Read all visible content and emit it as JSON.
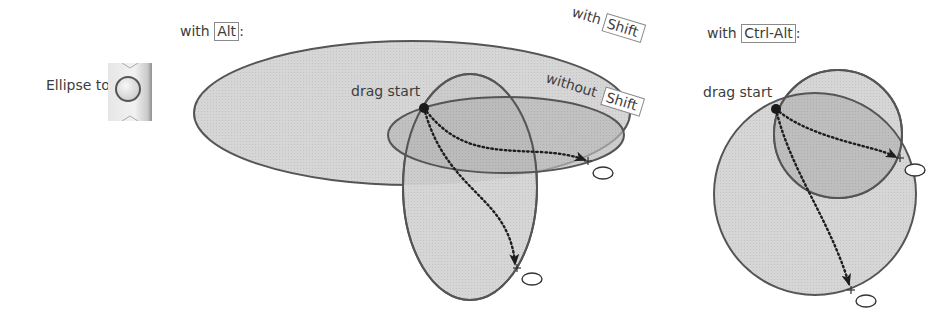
{
  "tool": {
    "label": "Ellipse tool",
    "icon": "ellipse-tool-icon"
  },
  "alt_panel": {
    "prefix": "with",
    "key": "Alt",
    "suffix": ":",
    "drag_start_label": "drag start",
    "with_shift_prefix": "with",
    "with_shift_key": "Shift",
    "without_shift_prefix": "without",
    "without_shift_key": "Shift"
  },
  "ctrl_alt_panel": {
    "prefix": "with",
    "key": "Ctrl-Alt",
    "suffix": ":",
    "drag_start_label": "drag start"
  },
  "colors": {
    "fill_light": "#d4d4d4",
    "fill_dark": "#b4b4b4",
    "stroke": "#555555",
    "dot": "#1a1a1a",
    "background": "#ffffff"
  }
}
